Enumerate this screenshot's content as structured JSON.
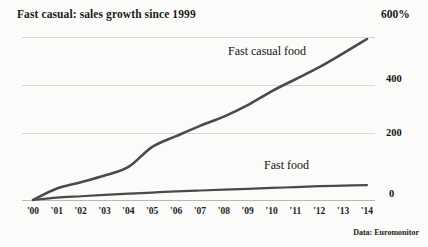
{
  "chart_data": {
    "type": "line",
    "title": "Fast casual: sales growth since 1999",
    "xlabel": "",
    "ylabel": "",
    "ylim": [
      0,
      600
    ],
    "yticks": [
      0,
      200,
      400,
      600
    ],
    "ytick_labels": [
      "0",
      "200",
      "400",
      "600%"
    ],
    "grid": true,
    "legend_position": "inline-annotation",
    "source_note": "Data: Euromonitor",
    "categories": [
      "'00",
      "'01",
      "'02",
      "'03",
      "'04",
      "'05",
      "'06",
      "'07",
      "'08",
      "'09",
      "'10",
      "'11",
      "'12",
      "'13",
      "'14"
    ],
    "series": [
      {
        "name": "Fast casual food",
        "color": "#4a4a4a",
        "values": [
          0,
          40,
          62,
          85,
          115,
          185,
          222,
          258,
          290,
          330,
          378,
          420,
          462,
          510,
          560
        ]
      },
      {
        "name": "Fast food",
        "color": "#4a4a4a",
        "values": [
          0,
          8,
          13,
          18,
          22,
          26,
          30,
          33,
          36,
          39,
          42,
          45,
          48,
          50,
          52
        ]
      }
    ]
  },
  "annotations": {
    "casual_label": "Fast casual food",
    "fastfood_label": "Fast food"
  },
  "colors": {
    "background": "#fbfbf9",
    "line": "#4a4a4a",
    "grid": "#d8d8d4",
    "text": "#1a1a1a"
  }
}
